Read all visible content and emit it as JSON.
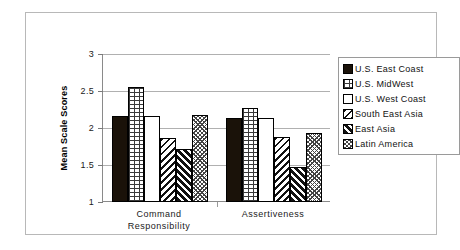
{
  "chart_data": {
    "type": "bar",
    "title": "",
    "subtitle": "",
    "xlabel": "",
    "ylabel": "Mean Scale Scores",
    "ylim": [
      1,
      3
    ],
    "yticks": [
      "1",
      "1.5",
      "2",
      "2.5",
      "3"
    ],
    "ytick_values": [
      1,
      1.5,
      2,
      2.5,
      3
    ],
    "grid": true,
    "legend_position": "right",
    "categories": [
      "Command Responsibility",
      "Assertiveness"
    ],
    "category_lines": [
      [
        "Command",
        "Responsibility"
      ],
      [
        "Assertiveness"
      ]
    ],
    "series": [
      {
        "name": "U.S. East Coast",
        "pattern": "solid",
        "values": [
          2.16,
          2.13
        ]
      },
      {
        "name": "U.S. MidWest",
        "pattern": "brick",
        "values": [
          2.56,
          2.27
        ]
      },
      {
        "name": "U.S. West Coast",
        "pattern": "empty",
        "values": [
          2.16,
          2.14
        ]
      },
      {
        "name": "South East Asia",
        "pattern": "diag-back",
        "values": [
          1.86,
          1.88
        ]
      },
      {
        "name": "East Asia",
        "pattern": "diag-fwd",
        "values": [
          1.71,
          1.47
        ]
      },
      {
        "name": "Latin America",
        "pattern": "crosshatch",
        "values": [
          2.17,
          1.93
        ]
      }
    ]
  },
  "legend": {
    "items": [
      {
        "label": "U.S. East Coast",
        "swatch": "solid-swatch"
      },
      {
        "label": "U.S. MidWest",
        "swatch": "brick-swatch"
      },
      {
        "label": "U.S. West Coast",
        "swatch": "empty-swatch"
      },
      {
        "label": "South East Asia",
        "swatch": "diagonal-back-swatch"
      },
      {
        "label": "East Asia",
        "swatch": "diagonal-forward-swatch"
      },
      {
        "label": "Latin America",
        "swatch": "crosshatch-swatch"
      }
    ]
  },
  "colors": {
    "bar_outline": "#000000",
    "solid_fill": "#1a1209",
    "gridline": "#b0b0b0",
    "axis": "#8a8a8a",
    "frame": "#b8b8b8",
    "text": "#111111"
  }
}
